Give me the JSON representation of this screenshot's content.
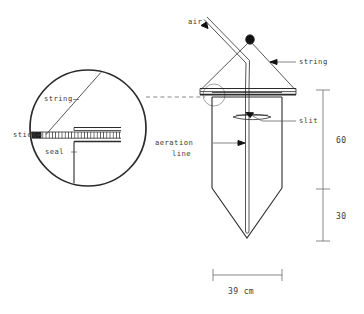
{
  "figure": {
    "background_color": "#ffffff",
    "line_color": "#2b2b2b",
    "text_color": "#3a3a3a"
  },
  "labels": {
    "air": "air",
    "string_main": "string",
    "slit": "slit",
    "aeration_line_1": "aeration",
    "aeration_line_2": "line",
    "detail_string": "string",
    "detail_stick": "stick",
    "detail_seal": "seal"
  },
  "dimensions": {
    "upper_height": "60",
    "lower_height": "30",
    "width": "39 cm"
  },
  "icons": {
    "air_arrow": "arrowhead-up-left-icon",
    "string_arrow": "arrowhead-left-icon",
    "aeration_arrow": "arrowhead-right-icon",
    "slit_pointer": "leader-line-icon",
    "knot": "filled-knot-icon",
    "detail_callout": "dashed-callout-icon"
  }
}
